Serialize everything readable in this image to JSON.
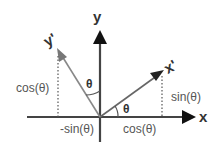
{
  "diagram": {
    "axes": {
      "x_label": "x",
      "y_label": "y",
      "x_prime_label": "x'",
      "y_prime_label": "y'"
    },
    "labels": {
      "theta_top": "θ",
      "theta_bottom": "θ",
      "cos_left": "cos(θ)",
      "neg_sin": "-sin(θ)",
      "cos_bottom": "cos(θ)",
      "sin_right": "sin(θ)"
    },
    "colors": {
      "axis": "#444444",
      "rotated_axis": "#777777",
      "dotted": "#555555",
      "text": "#555555"
    }
  }
}
